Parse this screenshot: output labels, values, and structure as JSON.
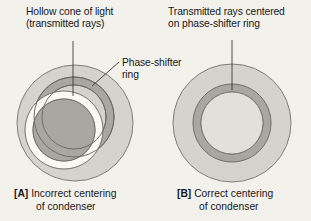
{
  "figure": {
    "background_color": "#f3f1ec",
    "annotations": {
      "hollow_cone": {
        "line1": "Hollow cone of light",
        "line2": "(transmitted rays)"
      },
      "transmitted_centered": {
        "line1": "Transmitted rays centered",
        "line2": "on phase-shifter ring"
      },
      "phase_shifter": {
        "line1": "Phase-shifter",
        "line2": "ring"
      }
    },
    "captions": {
      "a": {
        "tag": "[A]",
        "line1": "Incorrect centering",
        "line2": "of condenser"
      },
      "b": {
        "tag": "[B]",
        "line1": "Correct centering",
        "line2": "of condenser"
      }
    },
    "colors": {
      "outer_disc_fill": "#d5d3cd",
      "outer_disc_stroke": "#807e79",
      "phase_ring_fill": "#a9a7a2",
      "phase_ring_stroke": "#6f6d68",
      "cone_ring_fill": "#faf8f3",
      "cone_ring_stroke": "#73716c",
      "cone_core_fill": "#a9a7a2",
      "leader_line": "#3a3a3a",
      "text": "#181818"
    },
    "panels": [
      {
        "id": "A",
        "state": "incorrect",
        "outer_disc": {
          "cx": 75,
          "cy": 123,
          "r": 58
        },
        "phase_ring": {
          "cx": 74,
          "cy": 117,
          "r_outer": 40,
          "r_inner": 32
        },
        "cone_ring": {
          "cx": 64,
          "cy": 130,
          "r_outer": 39,
          "r_inner": 31
        },
        "offset_px": {
          "dx": -10,
          "dy": 13
        }
      },
      {
        "id": "B",
        "state": "correct",
        "outer_disc": {
          "cx": 232,
          "cy": 123,
          "r": 59
        },
        "phase_ring": {
          "cx": 232,
          "cy": 123,
          "r_outer": 39,
          "r_inner": 31
        },
        "cone_ring": {
          "cx": 232,
          "cy": 123,
          "r_outer": 39,
          "r_inner": 31
        },
        "offset_px": {
          "dx": 0,
          "dy": 0
        }
      }
    ],
    "leaders": [
      {
        "name": "hollow-cone-leader",
        "x1": 73,
        "y1": 41,
        "x2": 73,
        "y2": 96
      },
      {
        "name": "phase-shifter-leader",
        "x1": 119,
        "y1": 62,
        "x2": 92,
        "y2": 86
      },
      {
        "name": "transmitted-centered-leader",
        "x1": 232,
        "y1": 40,
        "x2": 232,
        "y2": 90
      }
    ]
  }
}
